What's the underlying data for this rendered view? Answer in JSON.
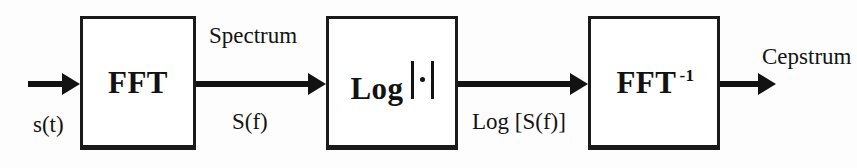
{
  "diagram": {
    "width": 857,
    "height": 168,
    "background_color": "#fdfdfd",
    "stroke_color": "#121212"
  },
  "blocks": [
    {
      "id": "fft",
      "label": "FFT",
      "superscript": "",
      "has_abs_bars": false,
      "x": 80,
      "y": 16,
      "width": 116,
      "height": 134
    },
    {
      "id": "log-abs",
      "label": "Log",
      "superscript": "",
      "has_abs_bars": true,
      "x": 326,
      "y": 16,
      "width": 132,
      "height": 134
    },
    {
      "id": "ifft",
      "label": "FFT",
      "superscript": "-1",
      "has_abs_bars": false,
      "x": 588,
      "y": 16,
      "width": 132,
      "height": 134
    }
  ],
  "arrows": [
    {
      "id": "input-arrow",
      "x": 28,
      "y": 84,
      "length": 52
    },
    {
      "id": "fft-to-log",
      "x": 196,
      "y": 84,
      "length": 130
    },
    {
      "id": "log-to-ifft",
      "x": 458,
      "y": 84,
      "length": 130
    },
    {
      "id": "output-arrow",
      "x": 720,
      "y": 84,
      "length": 58
    }
  ],
  "labels": {
    "input_signal": "s(t)",
    "spectrum_name": "Spectrum",
    "spectrum_symbol": "S(f)",
    "log_spectrum_symbol": "Log [S(f)]",
    "output_signal": "Cepstrum"
  }
}
